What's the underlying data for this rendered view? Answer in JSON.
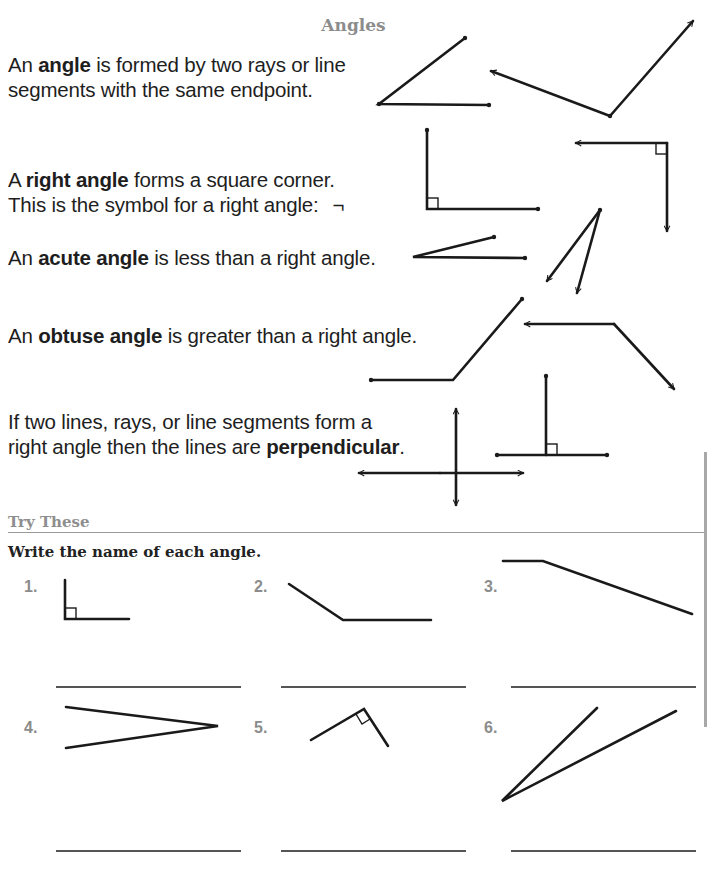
{
  "page": {
    "title": "Angles"
  },
  "definitions": [
    {
      "id": "angle",
      "line1_before": "An ",
      "line1_bold": "angle",
      "line1_after": " is formed by two rays or line",
      "line2": "segments with the same endpoint."
    },
    {
      "id": "right-angle",
      "line1_before": "A ",
      "line1_bold": "right angle",
      "line1_after": " forms a square corner.",
      "line2": "This is the symbol for a right angle:",
      "symbol": "¬"
    },
    {
      "id": "acute-angle",
      "line1_before": "An ",
      "line1_bold": "acute angle",
      "line1_after": " is less than a right angle."
    },
    {
      "id": "obtuse-angle",
      "line1_before": "An ",
      "line1_bold": "obtuse angle",
      "line1_after": " is greater than a right angle."
    },
    {
      "id": "perpendicular",
      "line1": "If two lines, rays, or line segments form a",
      "line2_before": "right angle then the lines are ",
      "line2_bold": "perpendicular",
      "line2_after": "."
    }
  ],
  "try_these": {
    "heading": "Try These",
    "instruction": "Write the name of each angle.",
    "items": [
      {
        "number": "1.",
        "answer": ""
      },
      {
        "number": "2.",
        "answer": ""
      },
      {
        "number": "3.",
        "answer": ""
      },
      {
        "number": "4.",
        "answer": ""
      },
      {
        "number": "5.",
        "answer": ""
      },
      {
        "number": "6.",
        "answer": ""
      }
    ]
  },
  "colors": {
    "heading_gray": "#8c8c8c",
    "text": "#1e1e1e",
    "figure_stroke": "#1a1a1a"
  }
}
